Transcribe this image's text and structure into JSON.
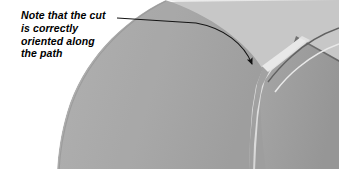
{
  "figure": {
    "kind": "technical-3d-render",
    "width": 339,
    "height": 175,
    "background_color": "#ffffff"
  },
  "annotation": {
    "text": "Note that the cut\nis correctly\noriented along\nthe path",
    "lines": [
      "Note that the cut",
      "is correctly",
      "oriented along",
      "the path"
    ],
    "text_color": "#000000",
    "style": "bold-italic",
    "leader": {
      "kind": "curved-arrow",
      "color": "#1a1a1a",
      "start_x": 118,
      "start_y": 18,
      "end_x": 251,
      "end_y": 73,
      "arrowhead": "filled-triangle"
    }
  },
  "model": {
    "description": "Shaded cylindrical solid with a swept cut groove following a curved path",
    "colors": {
      "highlight": "#f0f0f0",
      "upper_face": "#c9c9c9",
      "body_light": "#adadad",
      "body_mid": "#9f9f9f",
      "body_dark": "#6f6f6f",
      "edge_dark": "#5a5a5a",
      "cut_highlight": "#e8e8e8",
      "cut_shadow": "#8a8a8a"
    },
    "features": [
      {
        "name": "top-flat-face",
        "shade": "#c9c9c9"
      },
      {
        "name": "main-cylinder-face",
        "shade": "#adadad"
      },
      {
        "name": "shadow-side-face",
        "shade": "#6f6f6f"
      },
      {
        "name": "swept-cut-groove",
        "shade": "#e8e8e8"
      },
      {
        "name": "silhouette-edge",
        "shade": "#5a5a5a"
      }
    ]
  }
}
